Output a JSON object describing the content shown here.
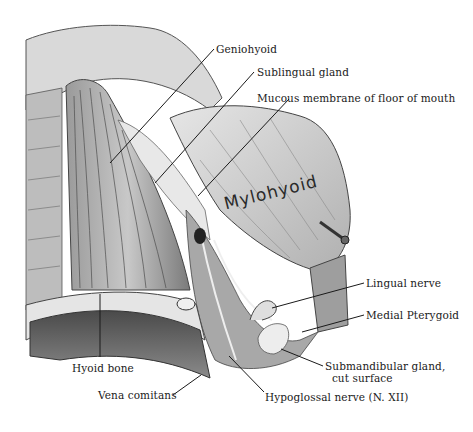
{
  "figure": {
    "type": "anatomical-illustration",
    "handwritten_label": "Mylohyoid",
    "labels": [
      {
        "id": "geniohyoid",
        "text": "Geniohyoid",
        "x": 216,
        "y": 43
      },
      {
        "id": "sublingual-gland",
        "text": "Sublingual gland",
        "x": 257,
        "y": 66
      },
      {
        "id": "mucous-membrane",
        "text": "Mucous membrane of floor of mouth",
        "x": 257,
        "y": 92
      },
      {
        "id": "lingual-nerve",
        "text": "Lingual nerve",
        "x": 366,
        "y": 277
      },
      {
        "id": "medial-pterygoid",
        "text": "Medial Pterygoid",
        "x": 366,
        "y": 309
      },
      {
        "id": "submandibular-gland",
        "text": "Submandibular gland,\n  cut surface",
        "x": 325,
        "y": 362
      },
      {
        "id": "hyoid-bone",
        "text": "Hyoid bone",
        "x": 72,
        "y": 362
      },
      {
        "id": "vena-comitans",
        "text": "Vena comitans",
        "x": 98,
        "y": 387
      },
      {
        "id": "hypoglossal-nerve",
        "text": "Hypoglossal nerve (N. XII)",
        "x": 265,
        "y": 392
      }
    ],
    "leader_lines": [
      {
        "id": "geniohyoid",
        "x1": 214,
        "y1": 49,
        "x2": 110,
        "y2": 163
      },
      {
        "id": "sublingual-gland",
        "x1": 254,
        "y1": 72,
        "x2": 155,
        "y2": 183
      },
      {
        "id": "mucous-membrane",
        "x1": 289,
        "y1": 99,
        "x2": 198,
        "y2": 196
      },
      {
        "id": "lingual-nerve",
        "x1": 364,
        "y1": 283,
        "x2": 272,
        "y2": 308
      },
      {
        "id": "medial-pterygoid",
        "x1": 364,
        "y1": 315,
        "x2": 302,
        "y2": 332
      },
      {
        "id": "submandibular-gland",
        "x1": 323,
        "y1": 366,
        "x2": 281,
        "y2": 349
      },
      {
        "id": "hyoid-bone",
        "x1": 100,
        "y1": 294,
        "x2": 100,
        "y2": 357
      },
      {
        "id": "vena-comitans",
        "x1": 173,
        "y1": 395,
        "x2": 201,
        "y2": 375
      },
      {
        "id": "hypoglossal-nerve",
        "x1": 264,
        "y1": 392,
        "x2": 229,
        "y2": 356
      }
    ]
  }
}
